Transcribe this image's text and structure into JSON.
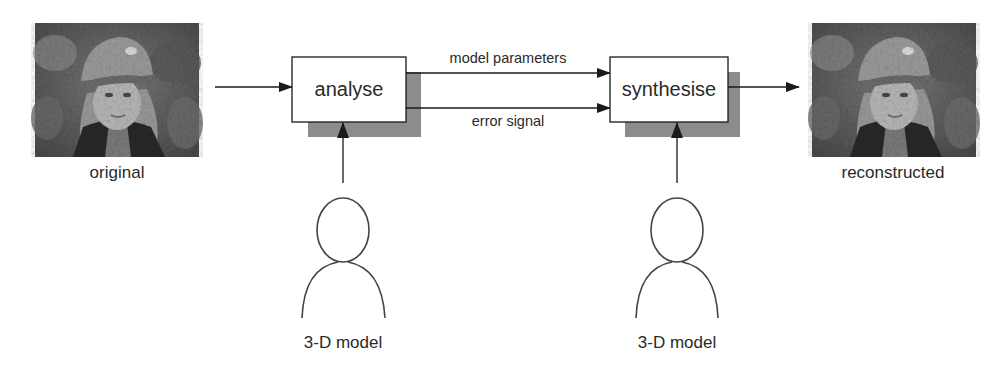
{
  "images": {
    "original": {
      "label": "original",
      "description": "photo of a child wearing a cap (grayscale)"
    },
    "reconstructed": {
      "label": "reconstructed",
      "description": "reconstructed photo of the child wearing a cap (grayscale)"
    }
  },
  "blocks": {
    "analyse": {
      "label": "analyse"
    },
    "synthesise": {
      "label": "synthesise"
    }
  },
  "connections": {
    "model_parameters": {
      "label": "model parameters"
    },
    "error_signal": {
      "label": "error signal"
    }
  },
  "models": [
    {
      "label": "3-D model"
    },
    {
      "label": "3-D model"
    }
  ],
  "colors": {
    "line": "#1a1a1a",
    "shadow": "#8c8c8c",
    "box_fill": "#ffffff",
    "figure_stroke": "#444444"
  }
}
